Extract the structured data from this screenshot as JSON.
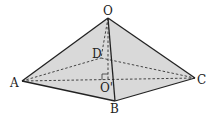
{
  "diagram": {
    "type": "square pyramid",
    "colors": {
      "fill": "#d9d9d9",
      "edge": "#222222",
      "background": "#ffffff"
    },
    "vertices": {
      "O": {
        "label": "O",
        "x": 108,
        "y": 18
      },
      "A": {
        "label": "A",
        "x": 22,
        "y": 81
      },
      "B": {
        "label": "B",
        "x": 115,
        "y": 101
      },
      "C": {
        "label": "C",
        "x": 195,
        "y": 78
      },
      "D": {
        "label": "D",
        "x": 101,
        "y": 58
      },
      "O_prime": {
        "label": "O'",
        "x": 108,
        "y": 80
      }
    },
    "solid_edges": [
      "OA",
      "OB",
      "OC",
      "AB",
      "BC"
    ],
    "dashed_edges": [
      "AD",
      "DC",
      "AC",
      "OD",
      "OO'"
    ],
    "annotations": [
      "right-angle marker at O'"
    ]
  }
}
